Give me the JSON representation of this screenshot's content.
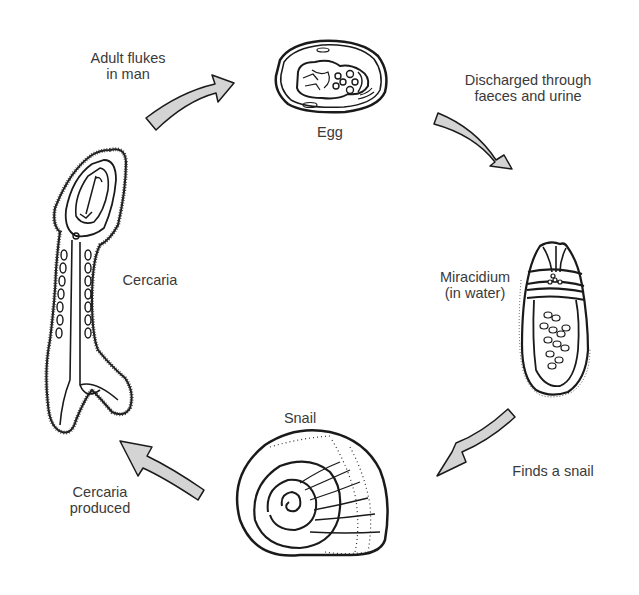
{
  "diagram": {
    "type": "life-cycle",
    "stages": [
      {
        "id": "egg",
        "label": "Egg"
      },
      {
        "id": "miracidium",
        "label_lines": [
          "Miracidium",
          "(in water)"
        ]
      },
      {
        "id": "snail",
        "label": "Snail"
      },
      {
        "id": "cercaria",
        "label": "Cercaria"
      }
    ],
    "transitions": [
      {
        "from": "adult",
        "to": "egg",
        "label_lines": [
          "Adult flukes",
          "in man"
        ]
      },
      {
        "from": "egg",
        "to": "miracidium",
        "label_lines": [
          "Discharged through",
          "faeces and urine"
        ]
      },
      {
        "from": "miracidium",
        "to": "snail",
        "label_lines": [
          "Finds a snail"
        ]
      },
      {
        "from": "snail",
        "to": "cercaria",
        "label_lines": [
          "Cercaria",
          "produced"
        ]
      }
    ],
    "colors": {
      "arrow_fill": "#d4d4d4",
      "stroke": "#1a1a1a",
      "text": "#3a3a3a",
      "background": "#ffffff"
    }
  }
}
